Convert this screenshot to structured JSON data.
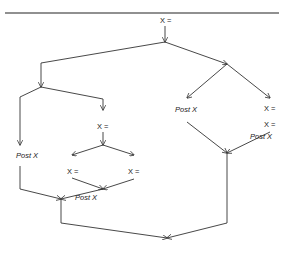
{
  "diagram": {
    "type": "control-flow-graph",
    "labels": {
      "root": "X =",
      "left_mid_assign": "X =",
      "left_inner_left_assign": "X =",
      "left_inner_right_assign": "X =",
      "left_inner_post": "Post X",
      "left_outer_post": "Post X",
      "right_post": "Post X",
      "right_assign_1": "X =",
      "right_assign_2": "X =",
      "right_post_2": "Post X"
    },
    "nodes": [
      {
        "id": "root",
        "label": "X =",
        "x": 165,
        "y": 20
      },
      {
        "id": "split1",
        "x": 165,
        "y": 42
      },
      {
        "id": "left_branch",
        "x": 41,
        "y": 87
      },
      {
        "id": "right_branch",
        "x": 227,
        "y": 64
      },
      {
        "id": "left_outer_post",
        "label": "Post X",
        "x": 20,
        "y": 155
      },
      {
        "id": "left_mid_assign",
        "label": "X =",
        "x": 103,
        "y": 126
      },
      {
        "id": "left_inner_left_assign",
        "label": "X =",
        "x": 73,
        "y": 171
      },
      {
        "id": "left_inner_right_assign",
        "label": "X =",
        "x": 134,
        "y": 171
      },
      {
        "id": "left_inner_post",
        "label": "Post X",
        "x": 91,
        "y": 196
      },
      {
        "id": "right_post",
        "label": "Post X",
        "x": 185,
        "y": 110
      },
      {
        "id": "right_assign_1",
        "label": "X =",
        "x": 270,
        "y": 109
      },
      {
        "id": "right_assign_2",
        "label": "X =",
        "x": 270,
        "y": 126
      },
      {
        "id": "right_post_2",
        "label": "Post X",
        "x": 262,
        "y": 137
      },
      {
        "id": "left_join",
        "x": 61,
        "y": 199
      },
      {
        "id": "right_join",
        "x": 227,
        "y": 153
      },
      {
        "id": "final_join",
        "x": 167,
        "y": 238
      }
    ]
  }
}
